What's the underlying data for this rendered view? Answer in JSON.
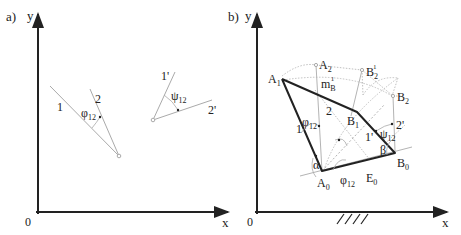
{
  "panel_a": {
    "label": "a)",
    "axes": {
      "x": "x",
      "y": "y",
      "origin": "0"
    },
    "lines": {
      "line1": "1",
      "line2": "2",
      "line1p": "1'",
      "line2p": "2'"
    },
    "angles": {
      "phi": "φ",
      "phi_sub": "12",
      "psi": "ψ",
      "psi_sub": "12"
    }
  },
  "panel_b": {
    "label": "b)",
    "axes": {
      "x": "x",
      "y": "y",
      "origin": "0"
    },
    "points": {
      "A1": "A",
      "A1_sub": "1",
      "A2": "A",
      "A2_sub": "2",
      "A0": "A",
      "A0_sub": "0",
      "B1": "B",
      "B1_sub": "1",
      "B2": "B",
      "B2_sub": "2",
      "B21": "B",
      "B21_sub": "2",
      "B21_sup": "1",
      "B0": "B",
      "B0_sub": "0",
      "E0": "E",
      "E0_sub": "0"
    },
    "midline": {
      "m": "m",
      "m_sub": "B",
      "m_sup": "1"
    },
    "links": {
      "l1": "1",
      "l2": "2",
      "l1p": "1'",
      "l2p": "2'"
    },
    "angles": {
      "phi": "φ",
      "phi_sub": "12",
      "phi2": "φ",
      "phi2_sub": "12",
      "psi": "ψ",
      "psi_sub": "12",
      "alpha": "α",
      "beta": "β"
    }
  },
  "colors": {
    "ink": "#222222",
    "thin": "#aaaaaa",
    "dotted": "#c0c0c0"
  }
}
